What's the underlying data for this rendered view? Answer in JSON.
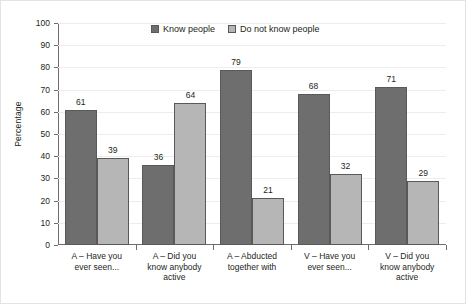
{
  "chart_data": {
    "type": "bar",
    "title": "",
    "xlabel": "",
    "ylabel": "Percentage",
    "ylim": [
      0,
      100
    ],
    "ytick_step": 10,
    "yticks": [
      0,
      10,
      20,
      30,
      40,
      50,
      60,
      70,
      80,
      90,
      100
    ],
    "grid": true,
    "legend_position": "top-center",
    "categories": [
      "A – Have you ever seen...",
      "A – Did you know anybody active",
      "A – Abducted together with",
      "V – Have you ever seen...",
      "V – Did you know anybody active"
    ],
    "category_lines": [
      [
        "A – Have you",
        "ever seen..."
      ],
      [
        "A  – Did you",
        "know anybody",
        "active"
      ],
      [
        "A – Abducted",
        "together with"
      ],
      [
        "V – Have you",
        "ever seen..."
      ],
      [
        "V – Did you",
        "know anybody",
        "active"
      ]
    ],
    "series": [
      {
        "name": "Know people",
        "color": "#6e6e6e",
        "values": [
          61,
          36,
          79,
          68,
          71
        ]
      },
      {
        "name": "Do not know people",
        "color": "#b6b6b6",
        "values": [
          39,
          64,
          21,
          32,
          29
        ]
      }
    ]
  },
  "colors": {
    "series_dark": "#6e6e6e",
    "series_light": "#b6b6b6",
    "bar_border": "#59595a",
    "axis": "#6d6d6d",
    "gridline": "#ededed",
    "text": "#231f20",
    "background": "#ffffff"
  }
}
